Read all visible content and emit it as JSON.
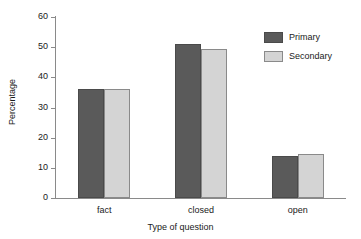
{
  "chart_data": {
    "type": "bar",
    "title": "",
    "subtitle": "",
    "xlabel": "Type of question",
    "ylabel": "Percentage",
    "categories": [
      "fact",
      "closed",
      "open"
    ],
    "series": [
      {
        "name": "Primary",
        "color": "#5a5a5a",
        "values": [
          36,
          51,
          14
        ]
      },
      {
        "name": "Secondary",
        "color": "#d4d4d4",
        "values": [
          36,
          49.5,
          14.5
        ]
      }
    ],
    "ylim": [
      0,
      60
    ],
    "ytick_labels": [
      "0",
      "10",
      "20",
      "30",
      "40",
      "50",
      "60"
    ],
    "ytick_values": [
      0,
      10,
      20,
      30,
      40,
      50,
      60
    ],
    "grid": false,
    "legend_position": "top-right",
    "legend_entries": [
      "Primary",
      "Secondary"
    ]
  }
}
